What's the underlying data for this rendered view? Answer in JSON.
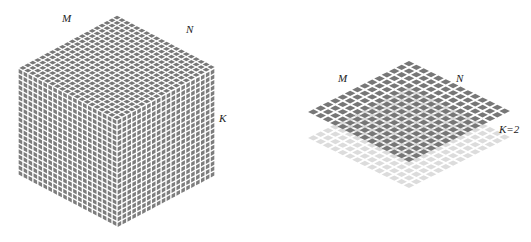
{
  "colors": {
    "background": "#ffffff",
    "cell_dark": "#777777",
    "cell_dark_side": "#7d7d7d",
    "cell_light": "#dcdcdc",
    "gridline": "#ffffff",
    "label": "#222222"
  },
  "cube": {
    "grid_cells": 20,
    "vertices": {
      "top": [
        117,
        15
      ],
      "left": [
        18,
        68
      ],
      "right": [
        215,
        68
      ],
      "front": [
        117,
        120
      ],
      "left_bottom": [
        18,
        175
      ],
      "right_bottom": [
        215,
        175
      ],
      "bottom": [
        117,
        228
      ]
    },
    "labels": {
      "m": {
        "text": "M",
        "x": 62,
        "y": 22
      },
      "n": {
        "text": "N",
        "x": 186,
        "y": 33
      },
      "k": {
        "text": "K",
        "x": 219,
        "y": 122
      }
    }
  },
  "slice": {
    "grid_cells": 14,
    "vertices": {
      "top": [
        409,
        60
      ],
      "left": [
        306,
        112
      ],
      "right": [
        497,
        112
      ],
      "bottom": [
        409,
        163
      ]
    },
    "lower_layer_offset": 26,
    "labels": {
      "m": {
        "text": "M",
        "x": 338,
        "y": 82
      },
      "n": {
        "text": "N",
        "x": 456,
        "y": 82
      },
      "k": {
        "text": "K=2",
        "x": 499,
        "y": 133
      }
    }
  }
}
